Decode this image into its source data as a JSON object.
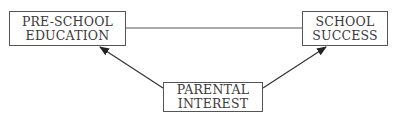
{
  "diagram": {
    "nodes": [
      {
        "id": "pre_school_education",
        "lines": [
          "PRE-SCHOOL",
          "EDUCATION"
        ]
      },
      {
        "id": "school_success",
        "lines": [
          "SCHOOL",
          "SUCCESS"
        ]
      },
      {
        "id": "parental_interest",
        "lines": [
          "PARENTAL",
          "INTEREST"
        ]
      }
    ],
    "edges": [
      {
        "from": "pre_school_education",
        "to": "school_success",
        "type": "line"
      },
      {
        "from": "parental_interest",
        "to": "pre_school_education",
        "type": "arrow"
      },
      {
        "from": "parental_interest",
        "to": "school_success",
        "type": "arrow"
      }
    ],
    "colors": {
      "stroke": "#555555",
      "text": "#3a3a3a",
      "arrow": "#222222",
      "background": "#ffffff"
    }
  }
}
